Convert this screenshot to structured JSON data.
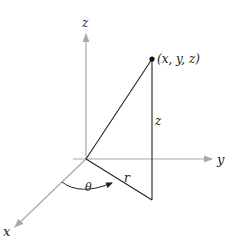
{
  "labels": {
    "z_axis": "z",
    "y_axis": "y",
    "x_axis": "x",
    "point": "(x, y, z)",
    "height": "z",
    "radius": "r",
    "angle": "θ"
  },
  "colors": {
    "axis": "#a8a8a8",
    "line": "#222222",
    "point": "#111111"
  }
}
